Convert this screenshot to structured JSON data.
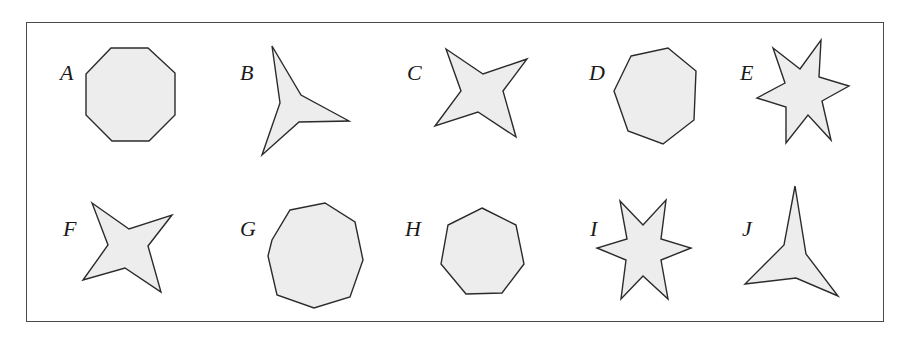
{
  "figure": {
    "shapes": [
      {
        "label": "A",
        "kind": "octagon",
        "points": "111,48 148,48 175,73 175,115 149,141 112,141 86,115 86,74",
        "label_pos": [
          60,
          62
        ]
      },
      {
        "label": "B",
        "kind": "three-point star",
        "points": "272,46 301,95 349,121 299,122 262,155 280,103",
        "label_pos": [
          240,
          62
        ]
      },
      {
        "label": "C",
        "kind": "four-point star",
        "points": "446,49 483,74 527,59 503,91 516,137 478,112 435,126 461,91",
        "label_pos": [
          407,
          62
        ]
      },
      {
        "label": "D",
        "kind": "heptagon",
        "points": "631,56 668,48 696,71 694,120 663,144 628,131 614,91",
        "label_pos": [
          589,
          62
        ]
      },
      {
        "label": "E",
        "kind": "six-point star",
        "points": "773,48 800,69 821,40 819,77 849,86 822,101 831,140 808,115 786,143 786,107 757,98 785,83",
        "label_pos": [
          740,
          62
        ]
      },
      {
        "label": "F",
        "kind": "four-point star",
        "points": "92,203 129,229 172,215 148,246 161,292 125,268 83,280 108,245",
        "label_pos": [
          63,
          218
        ]
      },
      {
        "label": "G",
        "kind": "nonagon",
        "points": "290,210 325,203 355,222 363,260 350,297 314,308 277,295 268,256 272,240",
        "label_pos": [
          240,
          218
        ]
      },
      {
        "label": "H",
        "kind": "heptagon",
        "points": "482,208 516,225 524,264 502,293 466,294 441,264 448,225",
        "label_pos": [
          405,
          218
        ]
      },
      {
        "label": "I",
        "kind": "six-point star",
        "points": "620,201 643,225 666,200 661,239 691,248 661,260 668,299 643,276 621,299 626,260 597,248 627,239",
        "label_pos": [
          590,
          218
        ]
      },
      {
        "label": "J",
        "kind": "three-point star",
        "points": "795,186 806,254 838,296 796,278 745,284 784,245",
        "label_pos": [
          742,
          218
        ]
      }
    ]
  }
}
